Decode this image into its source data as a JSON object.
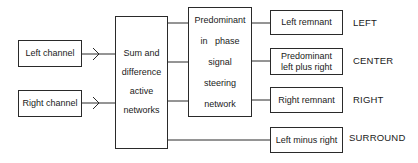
{
  "diagram": {
    "inputs": [
      {
        "id": "left_channel",
        "label": "Left channel"
      },
      {
        "id": "right_channel",
        "label": "Right channel"
      }
    ],
    "sum_difference": {
      "lines": [
        "Sum and",
        "difference",
        "active",
        "networks"
      ]
    },
    "steering": {
      "lines": [
        "Predominant",
        "in   phase",
        "signal",
        "steering",
        "network"
      ]
    },
    "outputs": [
      {
        "id": "left_remnant",
        "lines": [
          "Left remnant"
        ],
        "channel": "LEFT"
      },
      {
        "id": "predominant_lr",
        "lines": [
          "Predominant",
          "left plus right"
        ],
        "channel": "CENTER"
      },
      {
        "id": "right_remnant",
        "lines": [
          "Right remnant"
        ],
        "channel": "RIGHT"
      },
      {
        "id": "left_minus_right",
        "lines": [
          "Left minus right"
        ],
        "channel": "SURROUND"
      }
    ],
    "colors": {
      "line": "#2a2a2a",
      "background": "#ffffff"
    }
  }
}
